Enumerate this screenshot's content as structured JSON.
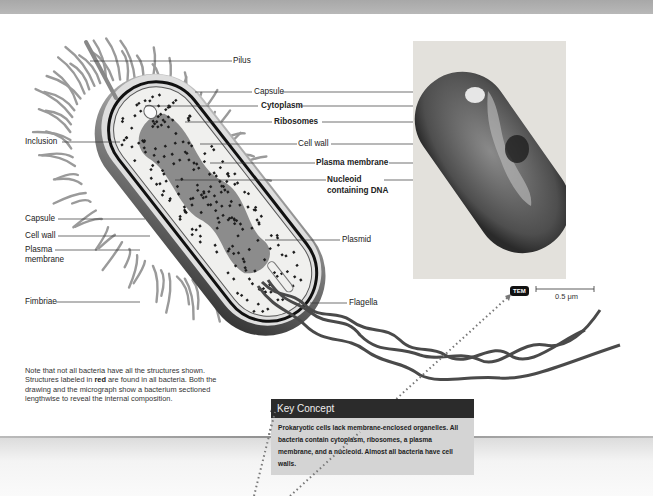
{
  "figure": {
    "drawing_labels_left": [
      {
        "id": "inclusion",
        "text": "Inclusion",
        "bold": false
      },
      {
        "id": "capsule-left",
        "text": "Capsule",
        "bold": false
      },
      {
        "id": "cell-wall-left",
        "text": "Cell wall",
        "bold": false
      },
      {
        "id": "plasma-membrane-left-1",
        "text": "Plasma",
        "bold": false
      },
      {
        "id": "plasma-membrane-left-2",
        "text": "membrane",
        "bold": false
      },
      {
        "id": "fimbriae",
        "text": "Fimbriae",
        "bold": false
      }
    ],
    "drawing_labels_right": [
      {
        "id": "pilus",
        "text": "Pilus",
        "bold": false
      },
      {
        "id": "capsule",
        "text": "Capsule",
        "bold": false
      },
      {
        "id": "cytoplasm",
        "text": "Cytoplasm",
        "bold": true
      },
      {
        "id": "ribosomes",
        "text": "Ribosomes",
        "bold": true
      },
      {
        "id": "cell-wall",
        "text": "Cell wall",
        "bold": false
      },
      {
        "id": "plasma-membrane",
        "text": "Plasma membrane",
        "bold": true
      },
      {
        "id": "nucleoid-1",
        "text": "Nucleoid",
        "bold": true
      },
      {
        "id": "nucleoid-2",
        "text": "containing DNA",
        "bold": true
      },
      {
        "id": "plasmid",
        "text": "Plasmid",
        "bold": false
      },
      {
        "id": "flagella",
        "text": "Flagella",
        "bold": false
      }
    ],
    "micrograph": {
      "badge": "TEM",
      "scale_label": "0.5 μm"
    },
    "note": {
      "part1": "Note that not all bacteria have all the structures shown. Structures labeled in ",
      "highlight": "red",
      "part2": " are found in all bacteria. Both the drawing and the micrograph show a bacterium sectioned lengthwise to reveal the internal composition."
    }
  },
  "key_concept": {
    "title": "Key Concept",
    "body": "Prokaryotic cells lack membrane-enclosed organelles. All bacteria contain cytoplasm, ribosomes, a plasma membrane, and a nucleoid. Almost all bacteria have cell walls."
  },
  "colors": {
    "key_concept_header": "#2b2b2b",
    "key_concept_body": "#d4d4d4",
    "flagella": "#4a4a4a",
    "annotation_arrow": "#777777"
  }
}
